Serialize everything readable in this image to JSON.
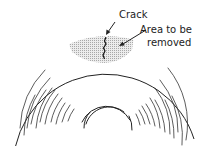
{
  "diagram": {
    "labels": {
      "crack": "Crack",
      "area_line1": "Area to be",
      "area_line2": "removed"
    },
    "colors": {
      "line": "#222222",
      "shade": "#cfcfcf",
      "background": "#ffffff"
    }
  }
}
